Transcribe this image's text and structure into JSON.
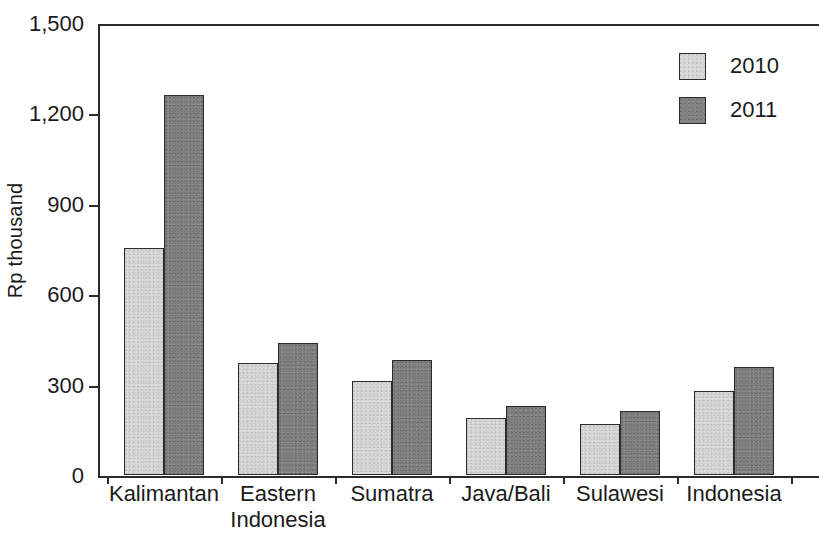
{
  "chart_data": {
    "type": "bar",
    "title": "",
    "xlabel": "",
    "ylabel": "Rp thousand",
    "ylim": [
      0,
      1500
    ],
    "yticks": [
      0,
      300,
      600,
      900,
      1200,
      1500
    ],
    "ytick_labels": [
      "0",
      "300",
      "600",
      "900",
      "1,200",
      "1,500"
    ],
    "grid": false,
    "legend_position": "top-right",
    "categories": [
      "Kalimantan",
      "Eastern Indonesia",
      "Sumatra",
      "Java/Bali",
      "Sulawesi",
      "Indonesia"
    ],
    "category_lines": [
      [
        "Kalimantan"
      ],
      [
        "Eastern",
        "Indonesia"
      ],
      [
        "Sumatra"
      ],
      [
        "Java/Bali"
      ],
      [
        "Sulawesi"
      ],
      [
        "Indonesia"
      ]
    ],
    "series": [
      {
        "name": "2010",
        "color": "#d9d9d9",
        "values": [
          755,
          372,
          313,
          190,
          168,
          280
        ]
      },
      {
        "name": "2011",
        "color": "#828282",
        "values": [
          1260,
          437,
          383,
          228,
          211,
          358
        ]
      }
    ]
  },
  "legend": {
    "items": [
      {
        "label": "2010",
        "swatch_class": "s2010"
      },
      {
        "label": "2011",
        "swatch_class": "s2011"
      }
    ]
  },
  "axis": {
    "y_title": "Rp thousand",
    "border_color": "#2b2b2b"
  }
}
